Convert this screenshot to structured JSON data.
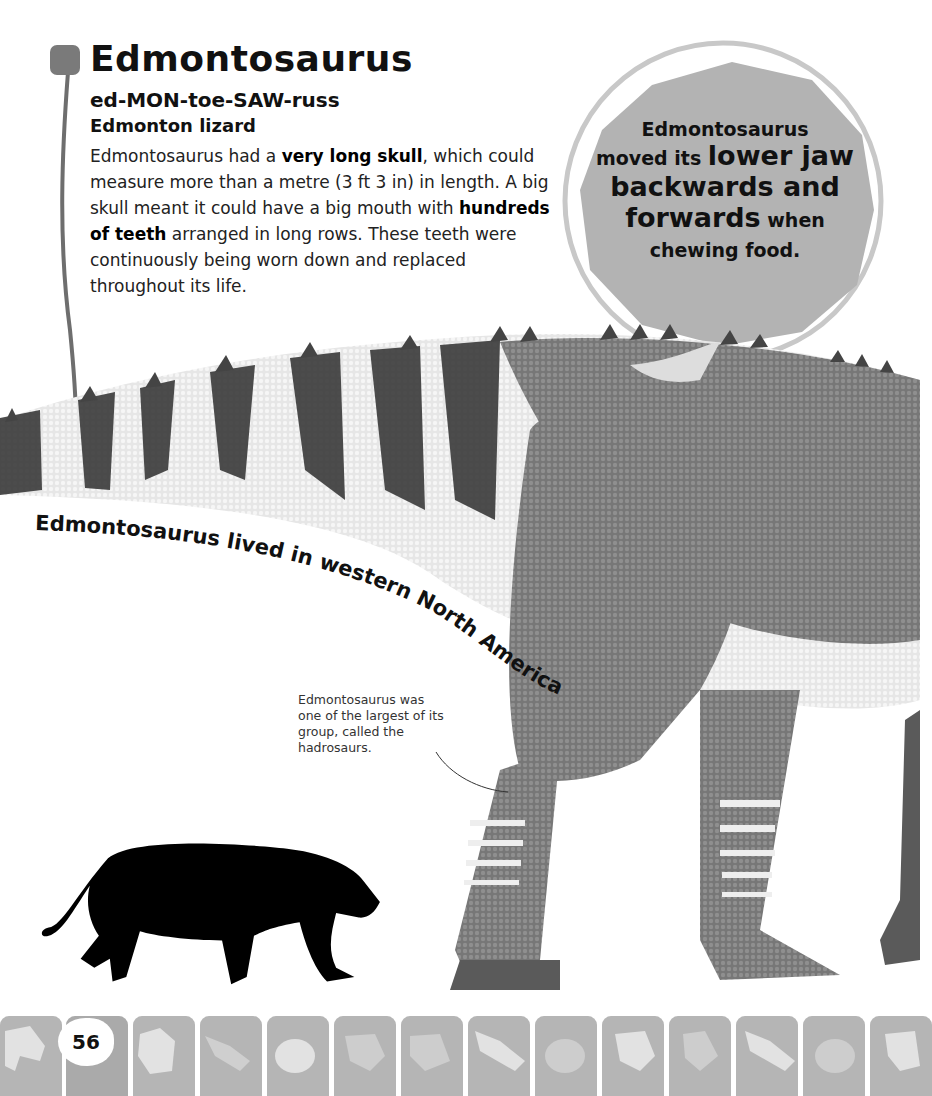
{
  "entry": {
    "title": "Edmontosaurus",
    "pronunciation": "ed-MON-toe-SAW-russ",
    "meaning": "Edmonton lizard",
    "body": {
      "p1": "Edmontosaurus had a ",
      "b1": "very long skull",
      "p2": ", which could measure more than a metre (3 ft 3 in) in length. A big skull meant it could have a big mouth with ",
      "b2": "hundreds of teeth",
      "p3": " arranged in long rows. These teeth were continuously being worn down and replaced throughout its life."
    }
  },
  "fact_bubble": {
    "line1": "Edmontosaurus",
    "line2_small": "moved its ",
    "line2_large": "lower jaw",
    "line3": "backwards and",
    "line4_large": "forwards",
    "line4_small": " when",
    "line5": "chewing food."
  },
  "curved_caption": "Edmontosaurus lived in western North America.",
  "annotation": "Edmontosaurus was one of the largest of its group, called the hadrosaurs.",
  "scale_silhouette": "lion-silhouette-icon",
  "footer": {
    "page_number": "56",
    "tiles": [
      "dino-footprint",
      "page-number",
      "three-toe-footprint",
      "claw-footprint",
      "round-footprint",
      "dino-footprint",
      "three-toe-footprint",
      "claw-footprint",
      "round-footprint",
      "dino-footprint",
      "three-toe-footprint",
      "claw-footprint",
      "round-footprint",
      "dino-footprint"
    ]
  },
  "colors": {
    "accent_gray": "#7a7a7a",
    "bubble_fill": "#b3b3b3",
    "tile_fill": "#b5b5b5"
  }
}
